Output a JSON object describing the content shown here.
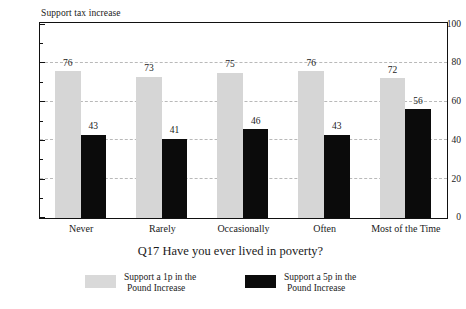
{
  "chart_data": {
    "type": "bar",
    "title": "",
    "xlabel": "Q17 Have you ever lived in poverty?",
    "ylabel": "Support tax increase",
    "ylim": [
      0,
      100
    ],
    "ytick_labels": [
      "0",
      "20",
      "40",
      "60",
      "80",
      "100"
    ],
    "ytick_values": [
      0,
      20,
      40,
      60,
      80,
      100
    ],
    "yminor_values": [
      10,
      30,
      50,
      70,
      90
    ],
    "grid": "horizontal-dashed",
    "legend_position": "bottom",
    "categories": [
      "Never",
      "Rarely",
      "Occasionally",
      "Often",
      "Most of the Time"
    ],
    "series": [
      {
        "name": "Support a 1p in the Pound Increase",
        "color": "#d6d6d6",
        "values": [
          76,
          73,
          75,
          76,
          72
        ]
      },
      {
        "name": "Support a 5p in the Pound Increase",
        "color": "#0b0b0b",
        "values": [
          43,
          41,
          46,
          43,
          56
        ]
      }
    ]
  },
  "legend": {
    "items": [
      {
        "line1": "Support a 1p in the",
        "line2": "Pound Increase"
      },
      {
        "line1": "Support a 5p in the",
        "line2": "Pound Increase"
      }
    ]
  },
  "axis": {
    "y_label": "Support tax increase",
    "x_title": "Q17 Have you ever lived in poverty?",
    "y_ticks": [
      "100",
      "80",
      "60",
      "40",
      "20",
      "0"
    ]
  }
}
